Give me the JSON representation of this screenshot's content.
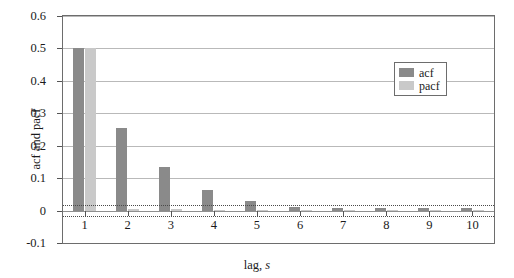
{
  "chart_data": {
    "type": "bar",
    "title": "",
    "subtitle": "",
    "xlabel_prefix": "lag, ",
    "xlabel_symbol": "s",
    "ylabel": "acf and pacf",
    "categories": [
      "1",
      "2",
      "3",
      "4",
      "5",
      "6",
      "7",
      "8",
      "9",
      "10"
    ],
    "series": [
      {
        "name": "acf",
        "color": "#8a8a8a",
        "values": [
          0.5,
          0.255,
          0.135,
          0.065,
          0.03,
          0.012,
          0.007,
          0.008,
          0.009,
          0.009
        ]
      },
      {
        "name": "pacf",
        "color": "#c9c9c9",
        "values": [
          0.5,
          0.006,
          0.004,
          0.002,
          0.002,
          0.002,
          0.002,
          0.002,
          0.002,
          0.002
        ]
      }
    ],
    "ylim": [
      -0.1,
      0.6
    ],
    "yticks": [
      -0.1,
      0,
      0.1,
      0.2,
      0.3,
      0.4,
      0.5,
      0.6
    ],
    "ytick_labels": [
      "-0.1",
      "0",
      "0.1",
      "0.2",
      "0.3",
      "0.4",
      "0.5",
      "0.6"
    ],
    "gridlines": [
      0.1,
      0.2,
      0.3,
      0.4,
      0.5,
      0.6
    ],
    "grid": true,
    "confidence_bands": [
      0.016,
      -0.016
    ],
    "legend_position": "top-right",
    "legend_entries": [
      "acf",
      "pacf"
    ]
  }
}
